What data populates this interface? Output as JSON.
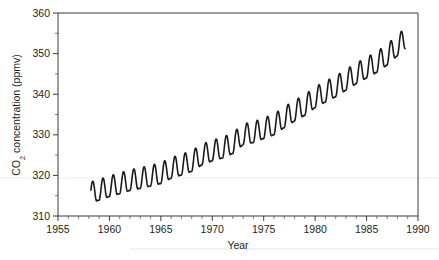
{
  "chart_data": {
    "type": "line",
    "title": "",
    "xlabel": "Year",
    "ylabel": "CO2 concentration (ppmv)",
    "ylabel_parts": {
      "pre": "CO",
      "sub": "2",
      "post": " concentration (ppmv)"
    },
    "xlim": [
      1955,
      1990
    ],
    "ylim": [
      310,
      360
    ],
    "x_major_ticks": [
      1955,
      1960,
      1965,
      1970,
      1975,
      1980,
      1985,
      1990
    ],
    "x_major_tick_labels": [
      "1955",
      "1960",
      "1965",
      "1970",
      "1975",
      "1980",
      "1985",
      "1990"
    ],
    "x_minor_tick_step": 1,
    "y_major_ticks": [
      310,
      320,
      330,
      340,
      350,
      360
    ],
    "y_major_tick_labels": [
      "310",
      "320",
      "330",
      "340",
      "350",
      "360"
    ],
    "y_minor_tick_step": 5,
    "grid": false,
    "legend": false,
    "legend_position": "none",
    "line_color": "#1a1a1a",
    "background_color": "#ffffff",
    "series": [
      {
        "name": "Monthly mean CO2 concentration",
        "description": "Keeling curve: monthly mean atmospheric CO2 with annual seasonal cycle superimposed on a rising trend",
        "x_start": 1958.2,
        "x_end": 1988.75,
        "annual_amplitude_ppmv": 3.1,
        "trend_start_ppmv": 315.0,
        "trend_end_ppmv": 351.8,
        "annual_means": [
          {
            "year": 1958,
            "value": 315.2
          },
          {
            "year": 1959,
            "value": 315.9
          },
          {
            "year": 1960,
            "value": 316.8
          },
          {
            "year": 1961,
            "value": 317.5
          },
          {
            "year": 1962,
            "value": 318.3
          },
          {
            "year": 1963,
            "value": 318.8
          },
          {
            "year": 1964,
            "value": 319.4
          },
          {
            "year": 1965,
            "value": 320.0
          },
          {
            "year": 1966,
            "value": 321.3
          },
          {
            "year": 1967,
            "value": 322.1
          },
          {
            "year": 1968,
            "value": 323.0
          },
          {
            "year": 1969,
            "value": 324.6
          },
          {
            "year": 1970,
            "value": 325.6
          },
          {
            "year": 1971,
            "value": 326.3
          },
          {
            "year": 1972,
            "value": 327.4
          },
          {
            "year": 1973,
            "value": 329.6
          },
          {
            "year": 1974,
            "value": 330.1
          },
          {
            "year": 1975,
            "value": 331.1
          },
          {
            "year": 1976,
            "value": 332.0
          },
          {
            "year": 1977,
            "value": 333.8
          },
          {
            "year": 1978,
            "value": 335.4
          },
          {
            "year": 1979,
            "value": 336.8
          },
          {
            "year": 1980,
            "value": 338.7
          },
          {
            "year": 1981,
            "value": 340.1
          },
          {
            "year": 1982,
            "value": 341.4
          },
          {
            "year": 1983,
            "value": 343.0
          },
          {
            "year": 1984,
            "value": 344.6
          },
          {
            "year": 1985,
            "value": 346.0
          },
          {
            "year": 1986,
            "value": 347.4
          },
          {
            "year": 1987,
            "value": 349.2
          },
          {
            "year": 1988,
            "value": 351.5
          }
        ],
        "seasonal_peak_month": 5,
        "seasonal_trough_month": 10,
        "notable_values": {
          "first_trough_ppmv": 313.9,
          "first_peak_ppmv": 318.2,
          "last_peak_ppmv": 356.2,
          "last_value_ppmv": 349.8
        }
      }
    ]
  },
  "figure": {
    "caption": ""
  }
}
